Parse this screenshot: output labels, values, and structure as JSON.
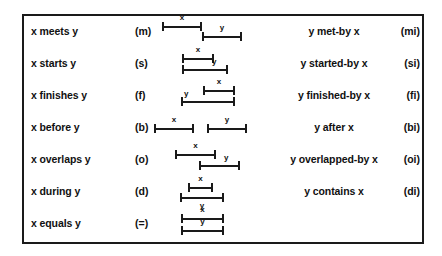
{
  "figure": {
    "title": "Allen's thirteen interval relations",
    "border_color": "#1a1a1a",
    "background": "#ffffff",
    "ink_color": "#111111"
  },
  "interval_labels": {
    "x": "x",
    "y": "y"
  },
  "rows": [
    {
      "left_label": "x meets y",
      "left_code": "(m)",
      "right_label": "y met-by x",
      "right_code": "(mi)"
    },
    {
      "left_label": "x starts y",
      "left_code": "(s)",
      "right_label": "y started-by x",
      "right_code": "(si)"
    },
    {
      "left_label": "x finishes y",
      "left_code": "(f)",
      "right_label": "y finished-by x",
      "right_code": "(fi)"
    },
    {
      "left_label": "x before y",
      "left_code": "(b)",
      "right_label": "y after x",
      "right_code": "(bi)"
    },
    {
      "left_label": "x overlaps y",
      "left_code": "(o)",
      "right_label": "y overlapped-by x",
      "right_code": "(oi)"
    },
    {
      "left_label": "x during y",
      "left_code": "(d)",
      "right_label": "y contains x",
      "right_code": "(di)"
    },
    {
      "left_label": "x equals y",
      "left_code": "(=)",
      "right_label": "",
      "right_code": ""
    }
  ]
}
